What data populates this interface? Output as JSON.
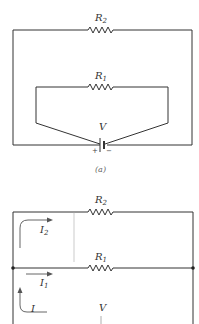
{
  "figure_a": {
    "caption": "(a)",
    "resistor_top": {
      "name": "R",
      "sub": "2"
    },
    "resistor_inner": {
      "name": "R",
      "sub": "1"
    },
    "battery": {
      "name": "V",
      "plus": "+",
      "minus": "−"
    }
  },
  "figure_b": {
    "resistor_top": {
      "name": "R",
      "sub": "2"
    },
    "resistor_mid": {
      "name": "R",
      "sub": "1"
    },
    "current_top": {
      "name": "I",
      "sub": "2"
    },
    "current_mid": {
      "name": "I",
      "sub": "1"
    },
    "current_total": {
      "name": "I"
    },
    "battery": {
      "name": "V"
    }
  },
  "colors": {
    "wire": "#333333",
    "label": "#333333",
    "arrow": "#555555"
  }
}
